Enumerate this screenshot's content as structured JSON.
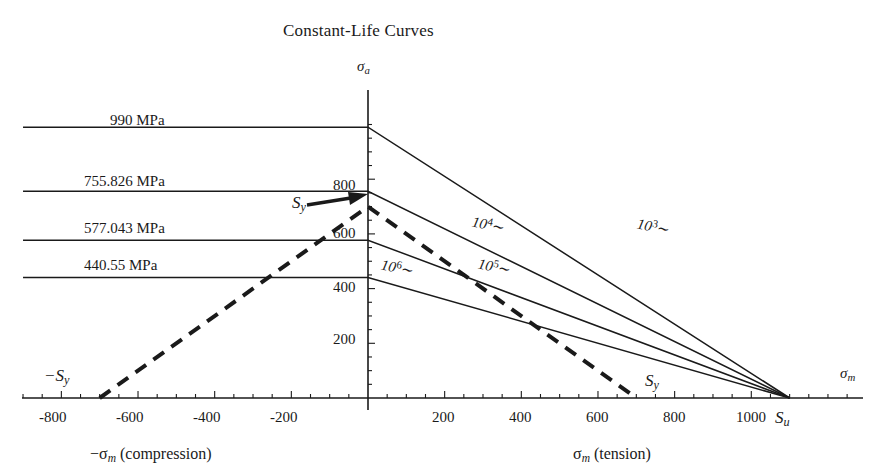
{
  "chart_data": {
    "type": "line",
    "title": "Constant-Life Curves",
    "xlabel_axis": "σm",
    "ylabel_axis": "σa",
    "xlabel_left": "−σm (compression)",
    "xlabel_right": "σm (tension)",
    "xlim": [
      -900,
      1350
    ],
    "ylim": [
      0,
      1060
    ],
    "grid": false,
    "legend": "inline-curve-labels",
    "x_ticks": [
      -800,
      -600,
      -400,
      -200,
      200,
      400,
      600,
      800,
      1000
    ],
    "x_tick_labels": [
      "-800",
      "-600",
      "-400",
      "-200",
      "200",
      "400",
      "600",
      "800",
      "1000"
    ],
    "y_ticks": [
      200,
      400,
      600,
      800
    ],
    "y_tick_labels": [
      "200",
      "400",
      "600",
      "800"
    ],
    "x_minor_tick_step": 50,
    "y_minor_tick_step": 50,
    "ultimate_strength": {
      "symbol": "Su",
      "value": 1100
    },
    "yield_strength": {
      "symbol": "Sy",
      "value": 700
    },
    "yield_strength_negative": {
      "symbol": "-Sy",
      "value": -700
    },
    "series": [
      {
        "name": "10^3~",
        "label": "10",
        "exponent": "3",
        "suffix": "~",
        "intercept_MPa": 990,
        "intercept_label": "990 MPa",
        "x_start": -900,
        "x_end": 1100,
        "style": "solid",
        "label_x": 640,
        "label_y": 235
      },
      {
        "name": "10^4~",
        "label": "10",
        "exponent": "4",
        "suffix": "~",
        "intercept_MPa": 755.826,
        "intercept_label": "755.826 MPa",
        "x_start": -900,
        "x_end": 1100,
        "style": "solid",
        "label_x": 480,
        "label_y": 235
      },
      {
        "name": "10^5~",
        "label": "10",
        "exponent": "5",
        "suffix": "~",
        "intercept_MPa": 577.043,
        "intercept_label": "577.043 MPa",
        "x_start": -900,
        "x_end": 1100,
        "style": "solid",
        "label_x": 480,
        "label_y": 277
      },
      {
        "name": "10^6~",
        "label": "10",
        "exponent": "6",
        "suffix": "~",
        "intercept_MPa": 440.55,
        "intercept_label": "440.55 MPa",
        "x_start": -900,
        "x_end": 1100,
        "style": "solid",
        "label_x": 385,
        "label_y": 277
      }
    ],
    "yield_line": {
      "name": "yield-line",
      "style": "dashed",
      "from": {
        "x": -700,
        "y": 0
      },
      "via": {
        "x": 0,
        "y": 700
      },
      "to": {
        "x": 700,
        "y": 0
      }
    }
  },
  "labels": {
    "title": "Constant-Life Curves",
    "y_axis_symbol": "σ",
    "y_axis_sub": "a",
    "x_axis_symbol": "σ",
    "x_axis_sub": "m",
    "left_caption_prefix": "−σ",
    "left_caption_sub": "m",
    "left_caption_suffix": " (compression)",
    "right_caption_prefix": "σ",
    "right_caption_sub": "m",
    "right_caption_suffix": " (tension)",
    "su_symbol": "S",
    "su_sub": "u",
    "sy_symbol": "S",
    "sy_sub": "y",
    "neg_sy_symbol": "−S",
    "neg_sy_sub": "y",
    "stress_990": "990 MPa",
    "stress_755": "755.826 MPa",
    "stress_577": "577.043 MPa",
    "stress_440": "440.55 MPa",
    "tick_m800": "-800",
    "tick_m600": "-600",
    "tick_m400": "-400",
    "tick_m200": "-200",
    "tick_200": "200",
    "tick_400": "400",
    "tick_600": "600",
    "tick_800": "800",
    "tick_1000": "1000",
    "tick_y200": "200",
    "tick_y400": "400",
    "tick_y600": "600",
    "tick_y800": "800",
    "curve_base": "10",
    "curve_exp_3": "3",
    "curve_exp_4": "4",
    "curve_exp_5": "5",
    "curve_exp_6": "6",
    "curve_tilde": "∼"
  },
  "colors": {
    "line": "#1a1a1a",
    "axis": "#1a1a1a",
    "background": "#ffffff"
  }
}
